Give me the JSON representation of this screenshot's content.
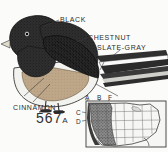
{
  "plate": {
    "type": "field-guide-illustration",
    "subject": "junco-perched-on-branch",
    "plate_number": "567",
    "plate_suffix": "A",
    "background_color": "#fbfbfa",
    "ink_color": "#2b2b2b"
  },
  "annotations": [
    {
      "id": "black",
      "label": "BLACK",
      "target": "head-and-breast",
      "color": "#1d1d1d"
    },
    {
      "id": "chestnut",
      "label": "CHESTNUT",
      "target": "back-mantle",
      "color": "#6b4a33"
    },
    {
      "id": "slate",
      "label": "SLATE-GRAY",
      "target": "wing-and-tail",
      "color": "#5c6168"
    },
    {
      "id": "cinnamon",
      "label": "CINNAMON",
      "target": "flank-and-side",
      "color": "#b89a7a"
    }
  ],
  "range_map": {
    "title": "",
    "region": "united-states",
    "shaded_area": "western-united-states",
    "shaded_color": "#6f6f6f",
    "unshaded_color": "#f4f4f2",
    "border_color": "#3a3a3a",
    "top_labels": [
      "A",
      "B",
      "F"
    ],
    "side_labels": [
      "C",
      "D"
    ]
  },
  "bird_colors": {
    "head": "#1c1c1c",
    "back": "#3b3b3b",
    "wing": "#2a2a2a",
    "flank": "#b9a184",
    "belly": "#efefec",
    "tail_dark": "#2b2b2b",
    "tail_light": "#ffffff",
    "bill": "#d9d4c6",
    "leg": "#4a4a4a",
    "eye": "#111111"
  }
}
